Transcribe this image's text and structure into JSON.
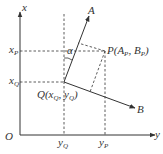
{
  "diagram": {
    "type": "coordinate-transformation",
    "colors": {
      "line": "#333333",
      "background": "#ffffff"
    },
    "axes": {
      "vertical_label": "x",
      "horizontal_label": "y",
      "origin_label": "O"
    },
    "points": {
      "Q": {
        "label": "Q(x",
        "sub1": "Q",
        "mid": ", y",
        "sub2": "Q",
        "end": ")"
      },
      "P": {
        "label": "P(A",
        "sub1": "P",
        "mid": ", B",
        "sub2": "P",
        "end": ")"
      }
    },
    "vectors": {
      "A": "A",
      "B": "B"
    },
    "angle_label": "α",
    "ticks": {
      "xP": {
        "main": "x",
        "sub": "P"
      },
      "xQ": {
        "main": "x",
        "sub": "Q"
      },
      "yQ": {
        "main": "y",
        "sub": "Q"
      },
      "yP": {
        "main": "y",
        "sub": "P"
      }
    }
  }
}
